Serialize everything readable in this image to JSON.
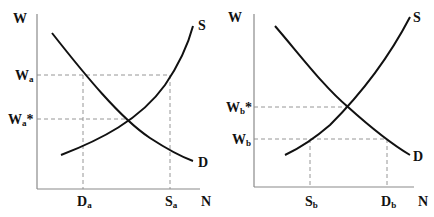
{
  "figure": {
    "panels": [
      {
        "id": "a",
        "y_axis_label": "W",
        "x_axis_label": "N",
        "supply_label": "S",
        "demand_label": "D",
        "wage_labels": [
          {
            "main": "W",
            "sub": "a",
            "suffix": ""
          },
          {
            "main": "W",
            "sub": "a",
            "suffix": "*"
          }
        ],
        "quantity_labels": [
          {
            "main": "D",
            "sub": "a"
          },
          {
            "main": "S",
            "sub": "a"
          }
        ],
        "description": "Wage above equilibrium: surplus of labor (Sa > Da)"
      },
      {
        "id": "b",
        "y_axis_label": "W",
        "x_axis_label": "N",
        "supply_label": "S",
        "demand_label": "D",
        "wage_labels": [
          {
            "main": "W",
            "sub": "b",
            "suffix": "*"
          },
          {
            "main": "W",
            "sub": "b",
            "suffix": ""
          }
        ],
        "quantity_labels": [
          {
            "main": "S",
            "sub": "b"
          },
          {
            "main": "D",
            "sub": "b"
          }
        ],
        "description": "Wage below equilibrium: shortage of labor (Db > Sb)"
      }
    ]
  },
  "colors": {
    "curve": "#111111",
    "axis": "#8a8a8a",
    "guide": "#8a8a8a",
    "background": "#ffffff"
  }
}
